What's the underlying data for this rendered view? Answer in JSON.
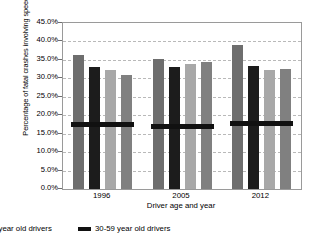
{
  "chart_data": {
    "type": "bar",
    "title": "",
    "subtitle": "",
    "xlabel": "Driver age and year",
    "ylabel": "Percentage of fatal crashes involving speeding",
    "categories": [
      "1996",
      "2005",
      "2012"
    ],
    "ylim": [
      0,
      45
    ],
    "ytick_labels": [
      "0.0%",
      "5.0%",
      "10.0%",
      "15.0%",
      "20.0%",
      "25.0%",
      "30.0%",
      "35.0%",
      "40.0%",
      "45.0%"
    ],
    "ytick_values": [
      0,
      5,
      10,
      15,
      20,
      25,
      30,
      35,
      40,
      45
    ],
    "grid": "horizontal-dashed",
    "legend_position": "bottom-left",
    "series": [
      {
        "name": "bar-1",
        "color": "#6e6e6e",
        "values": [
          36.3,
          35.3,
          39.0
        ]
      },
      {
        "name": "bar-2",
        "color": "#1c1c1c",
        "values": [
          33.0,
          33.1,
          33.3
        ]
      },
      {
        "name": "bar-3",
        "color": "#a8a8a8",
        "values": [
          32.3,
          33.8,
          32.3
        ]
      },
      {
        "name": "bar-4",
        "color": "#808080",
        "values": [
          30.8,
          34.4,
          32.6
        ]
      }
    ],
    "reference_line": {
      "name": "30-59 year old drivers",
      "color": "#111111",
      "values": [
        17.5,
        17.1,
        18.0
      ]
    },
    "annotations": []
  },
  "legend": {
    "items": [
      {
        "label": "9 year old drivers",
        "color": "#a8a8a8",
        "truncated": true
      },
      {
        "label": "30-59 year old drivers",
        "color": "#111111",
        "truncated": false
      }
    ]
  }
}
